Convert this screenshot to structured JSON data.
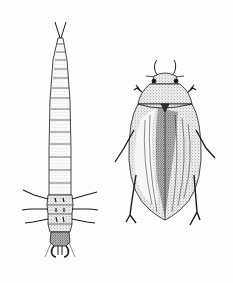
{
  "figure": {
    "background": "#fdfdfd",
    "ink": "#1a1a1a",
    "subjects": [
      {
        "id": "larva",
        "label": "water beetle larva",
        "position": "left"
      },
      {
        "id": "adult",
        "label": "adult diving beetle",
        "position": "right"
      }
    ]
  }
}
